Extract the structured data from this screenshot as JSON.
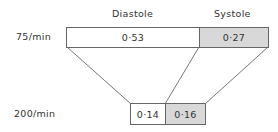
{
  "headers": {
    "diastole": "Diastole",
    "systole": "Systole"
  },
  "rows": [
    {
      "label": "75/min",
      "diastole": "0·53",
      "systole": "0·27"
    },
    {
      "label": "200/min",
      "diastole": "0·14",
      "systole": "0·16"
    }
  ],
  "colors": {
    "diastole_fill": "#ffffff",
    "systole_fill": "#d8d8d8",
    "stroke": "#666666"
  }
}
